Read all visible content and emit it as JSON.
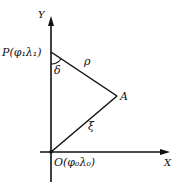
{
  "diagram": {
    "axes": {
      "x_label": "X",
      "y_label": "Y"
    },
    "points": {
      "P": {
        "name": "P",
        "coords": "(φ₁λ₁)"
      },
      "O": {
        "name": "O",
        "coords": "(φ₀λ₀)"
      },
      "A": {
        "name": "A"
      }
    },
    "segments": {
      "PA": {
        "label": "ρ"
      },
      "OA": {
        "label": "ξ"
      }
    },
    "angles": {
      "at_P": {
        "label": "δ"
      }
    },
    "colors": {
      "stroke": "#111111",
      "background": "#ffffff"
    }
  }
}
